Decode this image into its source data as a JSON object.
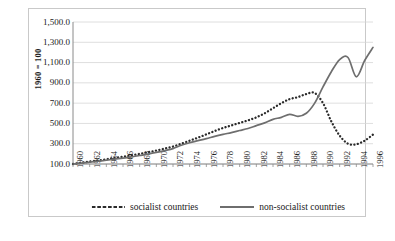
{
  "chart_data": {
    "type": "line",
    "title": "",
    "xlabel": "",
    "ylabel": "1960 = 100",
    "xlim": [
      1960,
      1996
    ],
    "ylim": [
      100,
      1500
    ],
    "grid": true,
    "legend_position": "bottom",
    "ytick_labels": [
      "1,500.0",
      "1,300.0",
      "1,100.0",
      "900.0",
      "700.0",
      "500.0",
      "300.0",
      "100.0"
    ],
    "ytick_values": [
      1500,
      1300,
      1100,
      900,
      700,
      500,
      300,
      100
    ],
    "xtick_labels": [
      "1960",
      "1962",
      "1964",
      "1966",
      "1968",
      "1970",
      "1972",
      "1974",
      "1976",
      "1978",
      "1980",
      "1982",
      "1984",
      "1986",
      "1988",
      "1990",
      "1992",
      "1994",
      "1996"
    ],
    "xtick_values": [
      1960,
      1962,
      1964,
      1966,
      1968,
      1970,
      1972,
      1974,
      1976,
      1978,
      1980,
      1982,
      1984,
      1986,
      1988,
      1990,
      1992,
      1994,
      1996
    ],
    "x": [
      1960,
      1961,
      1962,
      1963,
      1964,
      1965,
      1966,
      1967,
      1968,
      1969,
      1970,
      1971,
      1972,
      1973,
      1974,
      1975,
      1976,
      1977,
      1978,
      1979,
      1980,
      1981,
      1982,
      1983,
      1984,
      1985,
      1986,
      1987,
      1988,
      1989,
      1990,
      1991,
      1992,
      1993,
      1994,
      1995,
      1996
    ],
    "series": [
      {
        "name": "socialist countries",
        "style": "dotted",
        "color": "#2b2b2b",
        "values": [
          100,
          112,
          124,
          135,
          147,
          160,
          172,
          186,
          200,
          216,
          233,
          252,
          272,
          300,
          330,
          360,
          392,
          425,
          455,
          480,
          505,
          530,
          560,
          600,
          650,
          700,
          740,
          760,
          790,
          800,
          700,
          520,
          380,
          300,
          295,
          330,
          390
        ]
      },
      {
        "name": "non-socialist countries",
        "style": "solid",
        "color": "#6e6e6e",
        "values": [
          100,
          108,
          118,
          127,
          137,
          148,
          158,
          170,
          184,
          198,
          214,
          232,
          252,
          285,
          310,
          330,
          350,
          372,
          392,
          410,
          430,
          450,
          478,
          505,
          540,
          560,
          590,
          570,
          600,
          700,
          860,
          1010,
          1130,
          1150,
          960,
          1120,
          1250
        ]
      }
    ]
  },
  "legend": {
    "items": [
      {
        "label": "socialist countries",
        "marker": "dotted-line-marker"
      },
      {
        "label": "non-socialist countries",
        "marker": "solid-line-marker"
      }
    ]
  },
  "caption": {
    "text": ""
  }
}
